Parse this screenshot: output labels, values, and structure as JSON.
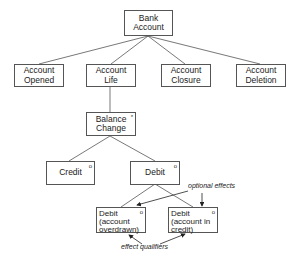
{
  "diagram": {
    "type": "JSP-style entity life history tree",
    "nodes": {
      "root": {
        "label": "Bank\nAccount"
      },
      "opened": {
        "label": "Account\nOpened"
      },
      "life": {
        "label": "Account\nLife"
      },
      "closure": {
        "label": "Account\nClosure"
      },
      "deletion": {
        "label": "Account\nDeletion"
      },
      "balance_change": {
        "label": "Balance\nChange",
        "marker": "*"
      },
      "credit": {
        "label": "Credit",
        "marker": "o"
      },
      "debit": {
        "label": "Debit",
        "marker": "o"
      },
      "debit_overdrawn": {
        "label": "Debit\n(account\noverdrawn)",
        "marker": "o"
      },
      "debit_in_credit": {
        "label": "Debit\n(account in\ncredit)",
        "marker": "o"
      }
    },
    "annotations": {
      "optional_effects": "optional effects",
      "effect_qualifiers": "effect qualifiers"
    },
    "edges": [
      [
        "root",
        "opened"
      ],
      [
        "root",
        "life"
      ],
      [
        "root",
        "closure"
      ],
      [
        "root",
        "deletion"
      ],
      [
        "life",
        "balance_change"
      ],
      [
        "balance_change",
        "credit"
      ],
      [
        "balance_change",
        "debit"
      ],
      [
        "debit",
        "debit_overdrawn"
      ],
      [
        "debit",
        "debit_in_credit"
      ]
    ]
  }
}
